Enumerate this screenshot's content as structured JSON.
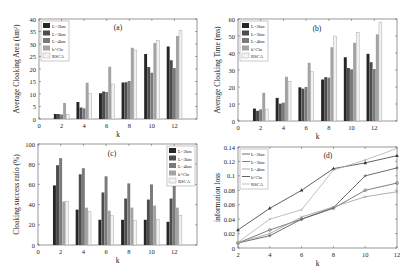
{
  "figure": {
    "series_names": [
      "L=2km",
      "L=3km",
      "L=4km",
      "k^Clo",
      "RSCA"
    ],
    "series_colors": [
      "#262626",
      "#4d4d4d",
      "#7a7a7a",
      "#a3a3a3",
      "#f2f2f2"
    ],
    "line_colors": [
      "#4a4a4a",
      "#5e5e5e",
      "#9a9a9a",
      "#3a3a3a",
      "#b0b0b0"
    ]
  },
  "chart_data": [
    {
      "id": "a",
      "type": "bar",
      "panel_label": "(a)",
      "title": "",
      "xlabel": "k",
      "ylabel": "Average Cloaking Area (km²)",
      "categories": [
        2,
        4,
        6,
        8,
        10,
        12
      ],
      "xlim": [
        0,
        14
      ],
      "xticks": [
        0,
        2,
        4,
        6,
        8,
        10,
        12
      ],
      "ylim": [
        0,
        40
      ],
      "yticks": [
        0,
        5,
        10,
        15,
        20,
        25,
        30,
        35,
        40
      ],
      "legend": "top-left",
      "series": [
        {
          "name": "L=2km",
          "values": [
            2.0,
            6.8,
            10.3,
            14.6,
            26.0,
            29.0
          ]
        },
        {
          "name": "L=3km",
          "values": [
            2.0,
            4.6,
            11.0,
            14.7,
            20.8,
            23.5
          ]
        },
        {
          "name": "L=4km",
          "values": [
            1.8,
            4.3,
            10.8,
            15.2,
            18.5,
            20.4
          ]
        },
        {
          "name": "k^Clo",
          "values": [
            6.4,
            14.5,
            20.9,
            28.5,
            30.4,
            33.2
          ]
        },
        {
          "name": "RSCA",
          "values": [
            1.8,
            10.2,
            14.0,
            27.6,
            31.4,
            35.5
          ]
        }
      ]
    },
    {
      "id": "b",
      "type": "bar",
      "panel_label": "(b)",
      "title": "",
      "xlabel": "k",
      "ylabel": "Average Cloaking Time (ms)",
      "categories": [
        2,
        4,
        6,
        8,
        10,
        12
      ],
      "xlim": [
        0,
        14
      ],
      "xticks": [
        0,
        2,
        4,
        6,
        8,
        10,
        12
      ],
      "ylim": [
        0,
        60
      ],
      "yticks": [
        0,
        10,
        20,
        30,
        40,
        50,
        60
      ],
      "legend": "top-left",
      "series": [
        {
          "name": "L=2km",
          "values": [
            7.3,
            13.6,
            19.8,
            24.4,
            37.5,
            39.5
          ]
        },
        {
          "name": "L=3km",
          "values": [
            6.0,
            10.2,
            19.0,
            25.8,
            31.2,
            34.6
          ]
        },
        {
          "name": "L=4km",
          "values": [
            6.8,
            10.8,
            20.0,
            25.5,
            30.4,
            30.6
          ]
        },
        {
          "name": "k^Clo",
          "values": [
            16.6,
            26.0,
            34.2,
            43.4,
            46.0,
            51.0
          ]
        },
        {
          "name": "RSCA",
          "values": [
            7.0,
            23.4,
            29.0,
            50.0,
            52.2,
            58.2
          ]
        }
      ]
    },
    {
      "id": "c",
      "type": "bar",
      "panel_label": "(c)",
      "title": "",
      "xlabel": "k",
      "ylabel": "Cloaking success ratio (%)",
      "categories": [
        2,
        4,
        6,
        8,
        10,
        12
      ],
      "xlim": [
        0,
        14
      ],
      "xticks": [
        0,
        2,
        4,
        6,
        8,
        10,
        12
      ],
      "ylim": [
        0,
        100
      ],
      "yticks": [
        0,
        20,
        40,
        60,
        80,
        100
      ],
      "legend": "top-right",
      "series": [
        {
          "name": "L=2km",
          "values": [
            59,
            35,
            25,
            25,
            25,
            23
          ]
        },
        {
          "name": "L=3km",
          "values": [
            79,
            70,
            52,
            46,
            45,
            46
          ]
        },
        {
          "name": "L=4km",
          "values": [
            86,
            76,
            68,
            61,
            60,
            60
          ]
        },
        {
          "name": "k^Clo",
          "values": [
            43,
            37,
            34,
            37,
            39,
            37
          ]
        },
        {
          "name": "RSCA",
          "values": [
            43,
            33,
            29,
            24,
            25,
            29
          ]
        }
      ]
    },
    {
      "id": "d",
      "type": "line",
      "panel_label": "(d)",
      "title": "",
      "xlabel": "k",
      "ylabel": "information loss",
      "x": [
        2,
        4,
        6,
        8,
        10,
        12
      ],
      "xlim": [
        2,
        12
      ],
      "xticks": [
        2,
        4,
        6,
        8,
        10,
        12
      ],
      "ylim": [
        0,
        0.14
      ],
      "yticks": [
        0,
        0.02,
        0.04,
        0.06,
        0.08,
        0.1,
        0.12,
        0.14
      ],
      "ytick_labels": [
        "0",
        "0.02",
        "0.04",
        "0.06",
        "0.08",
        "0.1",
        "0.12",
        "0.14"
      ],
      "legend": "top-left",
      "series": [
        {
          "name": "L=2km",
          "marker": "plus",
          "values": [
            0.007,
            0.017,
            0.04,
            0.056,
            0.1,
            0.111
          ]
        },
        {
          "name": "L=3km",
          "marker": "circle",
          "values": [
            0.007,
            0.025,
            0.04,
            0.055,
            0.08,
            0.09
          ]
        },
        {
          "name": "L=4km",
          "marker": "x",
          "values": [
            0.007,
            0.02,
            0.043,
            0.057,
            0.071,
            0.078
          ]
        },
        {
          "name": "k^Clo",
          "marker": "triangle",
          "values": [
            0.025,
            0.055,
            0.08,
            0.11,
            0.118,
            0.128
          ]
        },
        {
          "name": "RSCA",
          "marker": "dot",
          "values": [
            0.008,
            0.04,
            0.053,
            0.108,
            0.122,
            0.138
          ]
        }
      ]
    }
  ]
}
